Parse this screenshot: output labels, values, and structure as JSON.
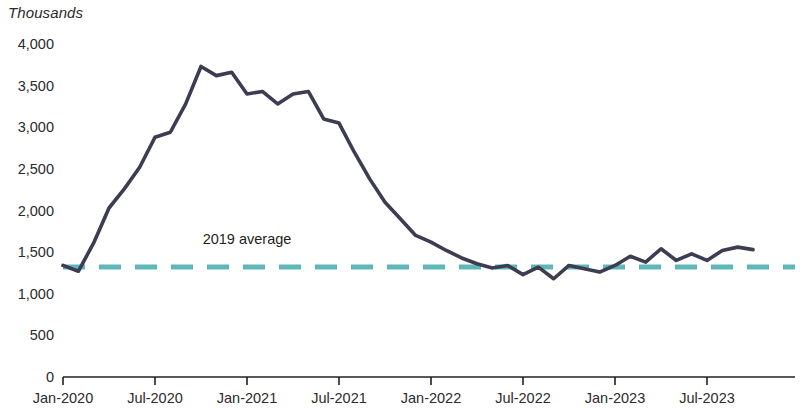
{
  "unit_label": "Thousands",
  "annotation": {
    "text": "2019 average"
  },
  "chart_data": {
    "type": "line",
    "title": "",
    "subtitle": "",
    "xlabel": "",
    "ylabel": "Thousands",
    "ylim": [
      0,
      4000
    ],
    "y_ticks": [
      0,
      500,
      1000,
      1500,
      2000,
      2500,
      3000,
      3500,
      4000
    ],
    "y_tick_labels": [
      "0",
      "500",
      "1,000",
      "1,500",
      "2,000",
      "2,500",
      "3,000",
      "3,500",
      "4,000"
    ],
    "grid": false,
    "legend_position": "none",
    "x_tick_labels": [
      "Jan-2020",
      "Jul-2020",
      "Jan-2021",
      "Jul-2021",
      "Jan-2022",
      "Jul-2022",
      "Jan-2023",
      "Jul-2023"
    ],
    "x_tick_months": [
      "2020-01",
      "2020-07",
      "2021-01",
      "2021-07",
      "2022-01",
      "2022-07",
      "2023-01",
      "2023-07"
    ],
    "colors": {
      "line": "#3c3c52",
      "average_line": "#5fb8b8",
      "axis": "#231f20",
      "text": "#231f20"
    },
    "series": [
      {
        "name": "Monthly value",
        "style": "solid",
        "color": "#3c3c52",
        "x": [
          "2020-01",
          "2020-02",
          "2020-03",
          "2020-04",
          "2020-05",
          "2020-06",
          "2020-07",
          "2020-08",
          "2020-09",
          "2020-10",
          "2020-11",
          "2020-12",
          "2021-01",
          "2021-02",
          "2021-03",
          "2021-04",
          "2021-05",
          "2021-06",
          "2021-07",
          "2021-08",
          "2021-09",
          "2021-10",
          "2021-11",
          "2021-12",
          "2022-01",
          "2022-02",
          "2022-03",
          "2022-04",
          "2022-05",
          "2022-06",
          "2022-07",
          "2022-08",
          "2022-09",
          "2022-10",
          "2022-11",
          "2022-12",
          "2023-01",
          "2023-02",
          "2023-03",
          "2023-04",
          "2023-05",
          "2023-06",
          "2023-07",
          "2023-08",
          "2023-09",
          "2023-10"
        ],
        "values": [
          1340,
          1270,
          1610,
          2030,
          2260,
          2520,
          2880,
          2940,
          3280,
          3730,
          3620,
          3660,
          3400,
          3430,
          3280,
          3400,
          3430,
          3100,
          3050,
          2700,
          2380,
          2100,
          1900,
          1700,
          1620,
          1520,
          1430,
          1360,
          1310,
          1340,
          1230,
          1320,
          1180,
          1340,
          1300,
          1260,
          1340,
          1450,
          1380,
          1540,
          1400,
          1480,
          1400,
          1520,
          1560,
          1530
        ]
      },
      {
        "name": "2019 average",
        "style": "dashed",
        "color": "#5fb8b8",
        "constant_value": 1320
      }
    ]
  }
}
